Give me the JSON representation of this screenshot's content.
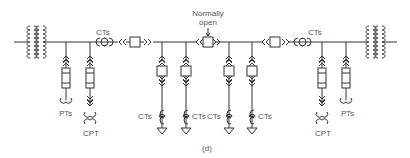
{
  "diagram": {
    "caption": "(d)",
    "normally_open_label_line1": "Normally",
    "normally_open_label_line2": "open",
    "labels": {
      "ct_left_bus": "CTs",
      "ct_right_bus": "CTs",
      "pt_left": "PTs",
      "cpt_left": "CPT",
      "pt_right": "PTs",
      "cpt_right": "CPT",
      "ct_feeder_1": "CTs",
      "ct_feeder_2": "CTs",
      "ct_feeder_3": "CTs",
      "ct_feeder_4": "CTs"
    },
    "colors": {
      "line": "#333333",
      "text": "#555555",
      "background": "#ffffff"
    }
  }
}
